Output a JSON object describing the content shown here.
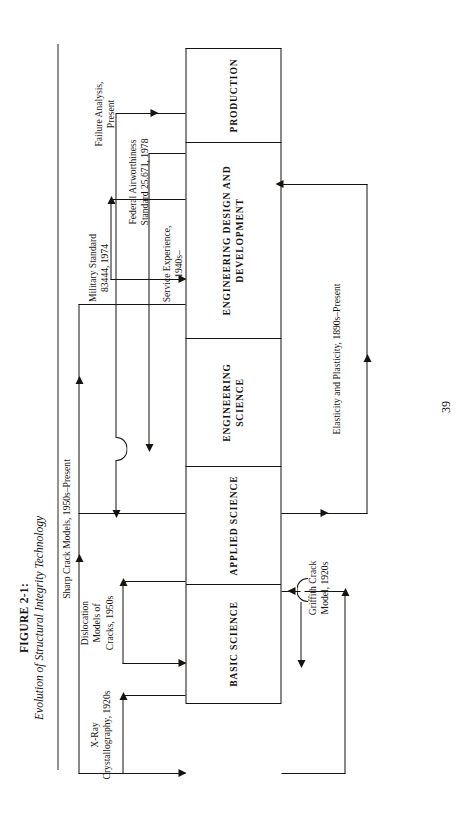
{
  "page": {
    "folio": "39",
    "caption_number": "FIGURE 2-1:",
    "caption_title": "Evolution of Structural Integrity Technology"
  },
  "spine": {
    "cells": [
      {
        "id": "basic-science",
        "label": "BASIC\nSCIENCE"
      },
      {
        "id": "applied-science",
        "label": "APPLIED\nSCIENCE"
      },
      {
        "id": "engineering-science",
        "label": "ENGINEERING\nSCIENCE"
      },
      {
        "id": "engineering-design",
        "label": "ENGINEERING\nDESIGN AND\nDEVELOPMENT"
      },
      {
        "id": "production",
        "label": "PRODUCTION"
      }
    ]
  },
  "annotations": {
    "xray": "X-Ray\nCrystallography, 1920s",
    "dislocation": "Dislocation\nModels of\nCracks, 1950s",
    "sharp_crack": "Sharp Crack Models, 1950s–Present",
    "mil_std": "Military Standard\n83444, 1974",
    "faa_std": "Federal Airworthiness\nStandard 25.671, 1978",
    "griffith": "Griffith Crack\nModel, 1920s",
    "elasticity": "Elasticity and Plasticity, 1890s–Present",
    "service": "Service Experience,\n1940s–",
    "failure": "Failure Analysis,\nPresent"
  },
  "colors": {
    "ink": "#17130f",
    "paper": "#ffffff"
  }
}
